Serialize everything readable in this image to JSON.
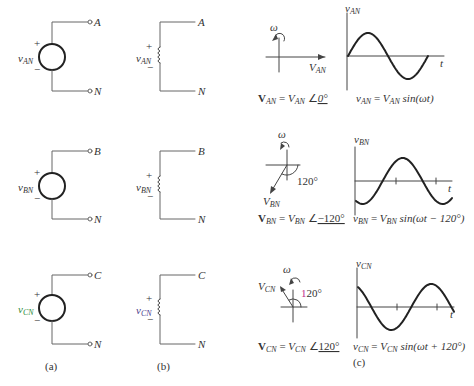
{
  "figure": {
    "captions": {
      "a": "(a)",
      "b": "(b)",
      "c": "(c)"
    },
    "colors": {
      "wire": "#666666",
      "source": "#222222",
      "curve": "#222222",
      "green_label": "#2e8b3a",
      "purple_label": "#4a3c8c",
      "magenta_angle": "#c0308c"
    },
    "rows": [
      {
        "phase": "AN",
        "source_label": "v",
        "source_sub": "AN",
        "terminal_top": "A",
        "terminal_bottom": "N",
        "plus": "+",
        "minus": "−",
        "omega": "ω",
        "phasor_label": "V",
        "phasor_sub": "AN",
        "phasor_angle_deg": 0,
        "angle_label": "",
        "phasor_eq": {
          "lhs": "V",
          "lhs_sub": "AN",
          "eq": " = ",
          "mag": "V",
          "mag_sub": "AN",
          "angle": "0°"
        },
        "wave_label": "v",
        "wave_sub": "AN",
        "axis_t": "t",
        "time_eq": {
          "lhs": "v",
          "lhs_sub": "AN",
          "eq": " = ",
          "mag": "V",
          "mag_sub": "AN",
          "fn": " sin(ωt)"
        }
      },
      {
        "phase": "BN",
        "source_label": "v",
        "source_sub": "BN",
        "terminal_top": "B",
        "terminal_bottom": "N",
        "plus": "+",
        "minus": "−",
        "omega": "ω",
        "phasor_label": "V",
        "phasor_sub": "BN",
        "phasor_angle_deg": -120,
        "angle_label": "120°",
        "phasor_eq": {
          "lhs": "V",
          "lhs_sub": "BN",
          "eq": " = ",
          "mag": "V",
          "mag_sub": "BN",
          "angle": "−120°"
        },
        "wave_label": "v",
        "wave_sub": "BN",
        "axis_t": "t",
        "time_eq": {
          "lhs": "v",
          "lhs_sub": "BN",
          "eq": " = ",
          "mag": "V",
          "mag_sub": "BN",
          "fn": " sin(ωt − 120°)"
        }
      },
      {
        "phase": "CN",
        "source_label": "v",
        "source_sub": "CN",
        "terminal_top": "C",
        "terminal_bottom": "N",
        "plus": "+",
        "minus": "−",
        "omega": "ω",
        "phasor_label": "V",
        "phasor_sub": "CN",
        "phasor_angle_deg": 120,
        "angle_label": "120°",
        "phasor_eq": {
          "lhs": "V",
          "lhs_sub": "CN",
          "eq": " = ",
          "mag": "V",
          "mag_sub": "CN",
          "angle": "120°"
        },
        "wave_label": "v",
        "wave_sub": "CN",
        "axis_t": "t",
        "time_eq": {
          "lhs": "v",
          "lhs_sub": "CN",
          "eq": " = ",
          "mag": "V",
          "mag_sub": "CN",
          "fn": " sin(ωt + 120°)"
        }
      }
    ]
  }
}
